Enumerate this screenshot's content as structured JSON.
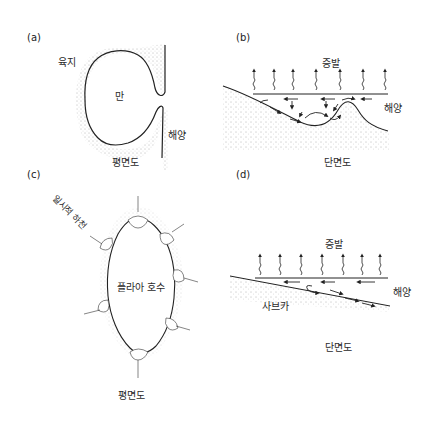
{
  "panels": {
    "a": {
      "letter": "(a)",
      "labels": {
        "land": "육지",
        "bay": "만",
        "ocean": "해양"
      },
      "caption": "평면도"
    },
    "b": {
      "letter": "(b)",
      "labels": {
        "evaporation": "증발",
        "ocean": "해양"
      },
      "caption": "단면도"
    },
    "c": {
      "letter": "(c)",
      "labels": {
        "ephemeral_stream": "일시적 하천",
        "playa_lake": "플라아 호수"
      },
      "caption": "평면도"
    },
    "d": {
      "letter": "(d)",
      "labels": {
        "evaporation": "증발",
        "ocean": "해양",
        "sabkha": "사브카"
      },
      "caption": "단면도"
    }
  },
  "colors": {
    "ink": "#2a2a2a",
    "stipple": "#555555",
    "background": "#ffffff"
  }
}
